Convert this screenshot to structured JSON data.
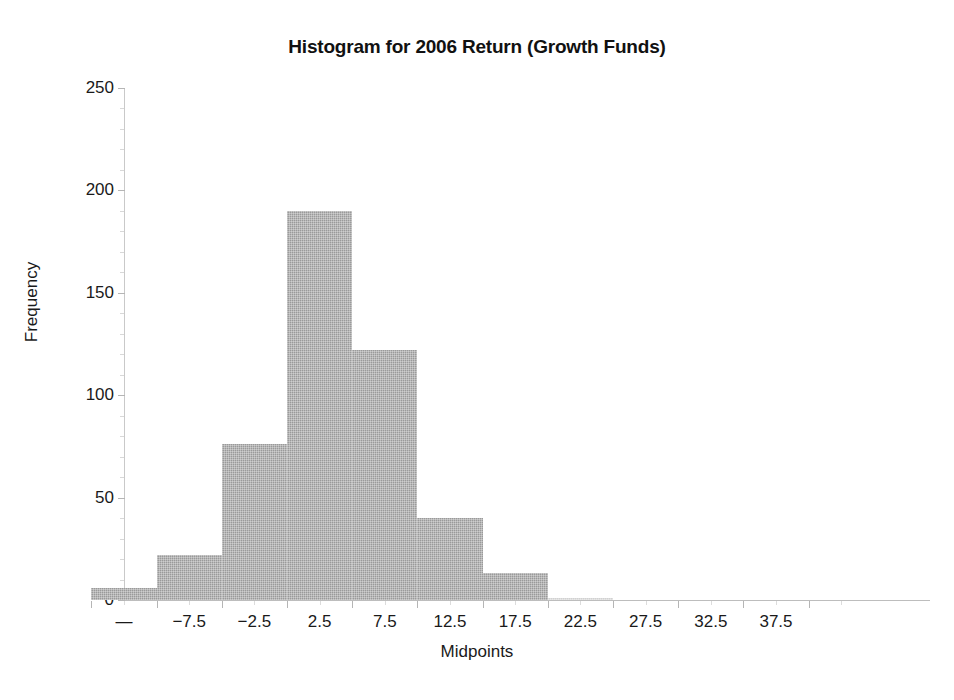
{
  "chart_data": {
    "type": "bar",
    "title": "Histogram for 2006 Return (Growth Funds)",
    "xlabel": "Midpoints",
    "ylabel": "Frequency",
    "categories": [
      "—",
      "-7.5",
      "-2.5",
      "2.5",
      "7.5",
      "12.5",
      "17.5",
      "22.5",
      "27.5",
      "32.5",
      "37.5"
    ],
    "values": [
      6,
      22,
      76,
      190,
      122,
      40,
      13,
      1,
      0,
      0,
      0
    ],
    "bar_color": "#9a9a9a",
    "grid": false,
    "legend": "none",
    "ylim": [
      0,
      250
    ],
    "ytick_labels": [
      "0",
      "50",
      "100",
      "150",
      "200",
      "250"
    ],
    "ytick_values": [
      0,
      50,
      100,
      150,
      200,
      250
    ],
    "xtick_labels": [
      "—",
      "-7.5",
      "-2.5",
      "2.5",
      "7.5",
      "12.5",
      "17.5",
      "22.5",
      "27.5",
      "32.5",
      "37.5"
    ]
  },
  "axis": {
    "y_title": "Frequency",
    "x_title": "Midpoints"
  }
}
